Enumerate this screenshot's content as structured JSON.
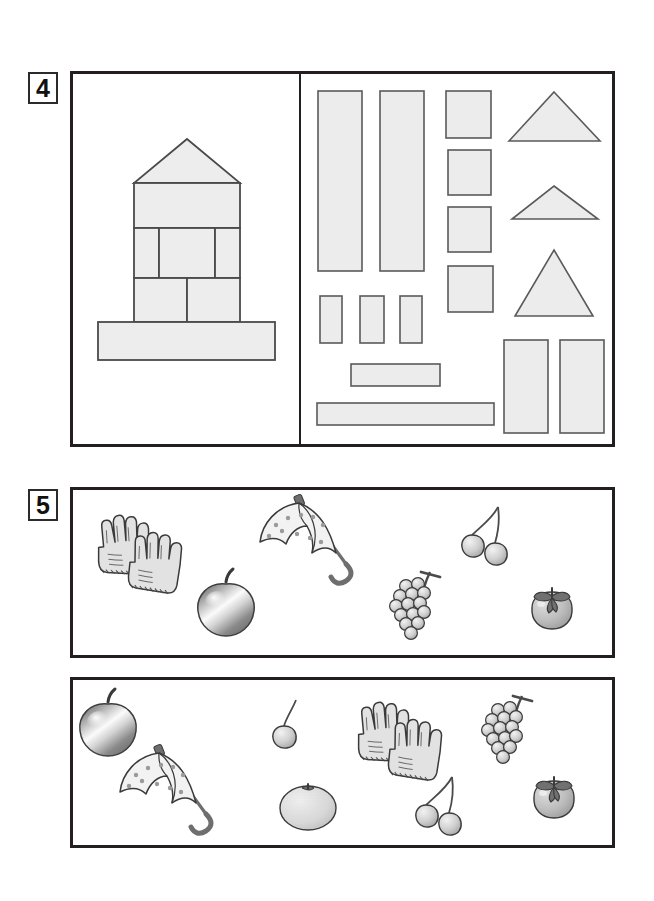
{
  "page": {
    "width": 654,
    "height": 901,
    "background": "#ffffff",
    "ink": "#231f20",
    "block_fill": "#ececec",
    "block_stroke": "#5a5a5a"
  },
  "exercises": [
    {
      "number": "4",
      "type": "block-construction",
      "left_panel": {
        "name": "model-figure",
        "description": "tower built from rectangular blocks with triangular roof",
        "parts": [
          {
            "shape": "triangle",
            "role": "roof"
          },
          {
            "shape": "rectangle",
            "role": "upper-wall-wide"
          },
          {
            "shape": "rectangle",
            "role": "middle-left-narrow"
          },
          {
            "shape": "rectangle",
            "role": "middle-center-wide"
          },
          {
            "shape": "rectangle",
            "role": "middle-right-narrow"
          },
          {
            "shape": "rectangle",
            "role": "lower-left-square"
          },
          {
            "shape": "rectangle",
            "role": "lower-right-square"
          },
          {
            "shape": "rectangle",
            "role": "base-bar"
          }
        ]
      },
      "right_panel": {
        "name": "block-supply",
        "description": "loose blocks available to build the figure",
        "pieces": [
          {
            "shape": "rectangle",
            "label": "tall-bar-1"
          },
          {
            "shape": "rectangle",
            "label": "tall-bar-2"
          },
          {
            "shape": "rectangle",
            "label": "square-1"
          },
          {
            "shape": "rectangle",
            "label": "square-2"
          },
          {
            "shape": "rectangle",
            "label": "square-3"
          },
          {
            "shape": "rectangle",
            "label": "square-4"
          },
          {
            "shape": "rectangle",
            "label": "small-bar-1"
          },
          {
            "shape": "rectangle",
            "label": "small-bar-2"
          },
          {
            "shape": "rectangle",
            "label": "small-bar-3"
          },
          {
            "shape": "rectangle",
            "label": "medium-horizontal-bar"
          },
          {
            "shape": "rectangle",
            "label": "long-horizontal-bar"
          },
          {
            "shape": "triangle",
            "label": "wide-triangle"
          },
          {
            "shape": "triangle",
            "label": "flat-triangle"
          },
          {
            "shape": "triangle",
            "label": "tall-triangle"
          },
          {
            "shape": "rectangle",
            "label": "upright-block-1"
          },
          {
            "shape": "rectangle",
            "label": "upright-block-2"
          }
        ]
      }
    },
    {
      "number": "5",
      "type": "picture-comparison",
      "rows": [
        {
          "name": "row-top",
          "items": [
            {
              "name": "gloves",
              "label": "gloves"
            },
            {
              "name": "apple",
              "label": "apple"
            },
            {
              "name": "umbrella",
              "label": "umbrella"
            },
            {
              "name": "cherries",
              "label": "cherries"
            },
            {
              "name": "grapes",
              "label": "grapes"
            },
            {
              "name": "persimmon",
              "label": "persimmon"
            }
          ]
        },
        {
          "name": "row-bottom",
          "items": [
            {
              "name": "apple",
              "label": "apple"
            },
            {
              "name": "umbrella",
              "label": "umbrella"
            },
            {
              "name": "cherry-single",
              "label": "cherry"
            },
            {
              "name": "orange",
              "label": "orange"
            },
            {
              "name": "gloves",
              "label": "gloves"
            },
            {
              "name": "grapes",
              "label": "grapes"
            },
            {
              "name": "cherries",
              "label": "cherries"
            },
            {
              "name": "persimmon",
              "label": "persimmon"
            }
          ]
        }
      ]
    }
  ]
}
